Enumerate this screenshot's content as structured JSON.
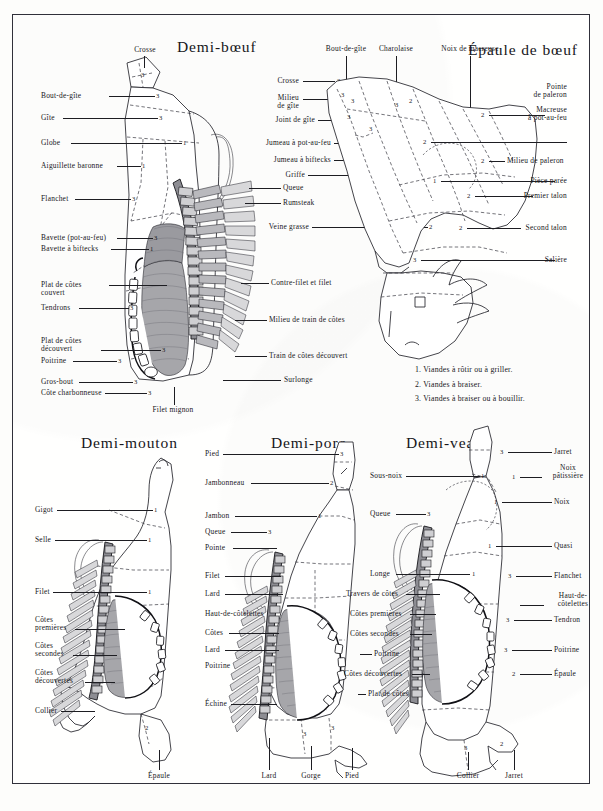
{
  "plate": {
    "title": "Planches de découpe des viandes de boucherie",
    "figures": [
      "Demi-bœuf",
      "Épaule de bœuf",
      "Demi-mouton",
      "Demi-porc",
      "Demi-veau"
    ]
  },
  "boeuf": {
    "title": "Demi-bœuf",
    "top_label": "Crosse",
    "left_labels": [
      {
        "text": "Bout-de-gîte",
        "num": "3"
      },
      {
        "text": "Gîte",
        "num": "3"
      },
      {
        "text": "Globe",
        "num": "1"
      },
      {
        "text": "Aiguillette baronne",
        "num": "1"
      },
      {
        "text": "Flanchet",
        "num": "3"
      },
      {
        "text": "Bavette (pot-au-feu)",
        "num": "3"
      },
      {
        "text": "Bavette à biftecks",
        "num": "1"
      },
      {
        "text": "Plat de côtes couvert",
        "num": "3"
      },
      {
        "text": "Tendrons",
        "num": "3"
      },
      {
        "text": "Plat de côtes découvert",
        "num": "3"
      },
      {
        "text": "Poitrine",
        "num": "3"
      },
      {
        "text": "Gros-bout",
        "num": "3"
      },
      {
        "text": "Côte charbonneuse",
        "num": "3"
      }
    ],
    "right_labels": [
      {
        "text": "Contre-filet et filet",
        "num": ""
      },
      {
        "text": "Milieu de train de côtes",
        "num": ""
      },
      {
        "text": "Train de côtes découvert",
        "num": ""
      },
      {
        "text": "Surlonge",
        "num": ""
      }
    ],
    "bottom_label": "Filet mignon",
    "shared_right_labels": [
      {
        "text": "Crosse",
        "num": "3"
      },
      {
        "text": "Milieu de gîte",
        "num": "3"
      },
      {
        "text": "Joint de gîte",
        "num": "3"
      },
      {
        "text": "Jumeau à pot-au-feu",
        "num": "2"
      },
      {
        "text": "Jumeau à biftecks",
        "num": "1"
      },
      {
        "text": "Griffe",
        "num": "2"
      },
      {
        "text": "Queue",
        "num": ""
      },
      {
        "text": "Rumsteak",
        "num": "3"
      },
      {
        "text": "Veine grasse",
        "num": "2"
      }
    ]
  },
  "epaule": {
    "title": "Épaule de bœuf",
    "top_labels": [
      "Bout-de-gîte",
      "Charolaise",
      "Noix de macreuse"
    ],
    "right_labels": [
      {
        "text": "Pointe de paleron",
        "num": "2"
      },
      {
        "text": "Macreuse à pot-au-feu",
        "num": "2"
      },
      {
        "text": "Milieu de paleron",
        "num": "2"
      },
      {
        "text": "Pièce parée",
        "num": "1"
      },
      {
        "text": "Premier talon",
        "num": "2"
      },
      {
        "text": "Second talon",
        "num": "2"
      },
      {
        "text": "Salière",
        "num": "3"
      }
    ]
  },
  "legend": {
    "items": [
      "1. Viandes à rôtir ou à griller.",
      "2. Viandes à braiser.",
      "3. Viandes à braiser ou à bouillir."
    ]
  },
  "mouton": {
    "title": "Demi-mouton",
    "left_labels": [
      {
        "text": "Gigot",
        "num": "1"
      },
      {
        "text": "Selle",
        "num": "1"
      },
      {
        "text": "Filet",
        "num": "1"
      },
      {
        "text": "Côtes premières",
        "num": ""
      },
      {
        "text": "Côtes secondes",
        "num": ""
      },
      {
        "text": "Côtes découvertes",
        "num": ""
      },
      {
        "text": "Collier",
        "num": ""
      }
    ],
    "bottom_label": "Épaule",
    "bottom_num": "2"
  },
  "porc": {
    "title": "Demi-porc",
    "left_labels": [
      {
        "text": "Pied",
        "num": "3"
      },
      {
        "text": "Jambonneau",
        "num": "2"
      },
      {
        "text": "Jambon",
        "num": "1"
      },
      {
        "text": "Queue",
        "num": "3"
      },
      {
        "text": "Pointe",
        "num": ""
      },
      {
        "text": "Filet",
        "num": ""
      },
      {
        "text": "Lard",
        "num": ""
      },
      {
        "text": "Haut-de-côtelettes",
        "num": "3"
      },
      {
        "text": "Côtes",
        "num": ""
      },
      {
        "text": "Lard",
        "num": ""
      },
      {
        "text": "Poitrine",
        "num": "3"
      },
      {
        "text": "Échine",
        "num": ""
      }
    ],
    "bottom_labels": [
      {
        "text": "Lard",
        "num": ""
      },
      {
        "text": "Gorge",
        "num": "3"
      },
      {
        "text": "Pied",
        "num": "3"
      }
    ]
  },
  "veau": {
    "title": "Demi-veau",
    "left_labels": [
      {
        "text": "Sous-noix",
        "num": "1"
      },
      {
        "text": "Queue",
        "num": "3"
      },
      {
        "text": "Longe",
        "num": "1"
      },
      {
        "text": "Travers de côtes",
        "num": ""
      },
      {
        "text": "Côtes premières",
        "num": ""
      },
      {
        "text": "Côtes secondes",
        "num": ""
      },
      {
        "text": "Poitrine",
        "num": ""
      },
      {
        "text": "Côtes découvertes",
        "num": ""
      },
      {
        "text": "Plat de côtes",
        "num": "2"
      }
    ],
    "right_labels": [
      {
        "text": "Jarret",
        "num": "3"
      },
      {
        "text": "Noix pâtissière",
        "num": "1"
      },
      {
        "text": "Noix",
        "num": "1"
      },
      {
        "text": "Quasi",
        "num": "1"
      },
      {
        "text": "Flanchet",
        "num": "3"
      },
      {
        "text": "Haut-de-côtelettes",
        "num": "3"
      },
      {
        "text": "Tendron",
        "num": "3"
      },
      {
        "text": "Poitrine",
        "num": "3"
      },
      {
        "text": "Épaule",
        "num": "2"
      }
    ],
    "bottom_labels": [
      {
        "text": "Collier",
        "num": "3"
      },
      {
        "text": "Jarret",
        "num": "2"
      }
    ]
  }
}
